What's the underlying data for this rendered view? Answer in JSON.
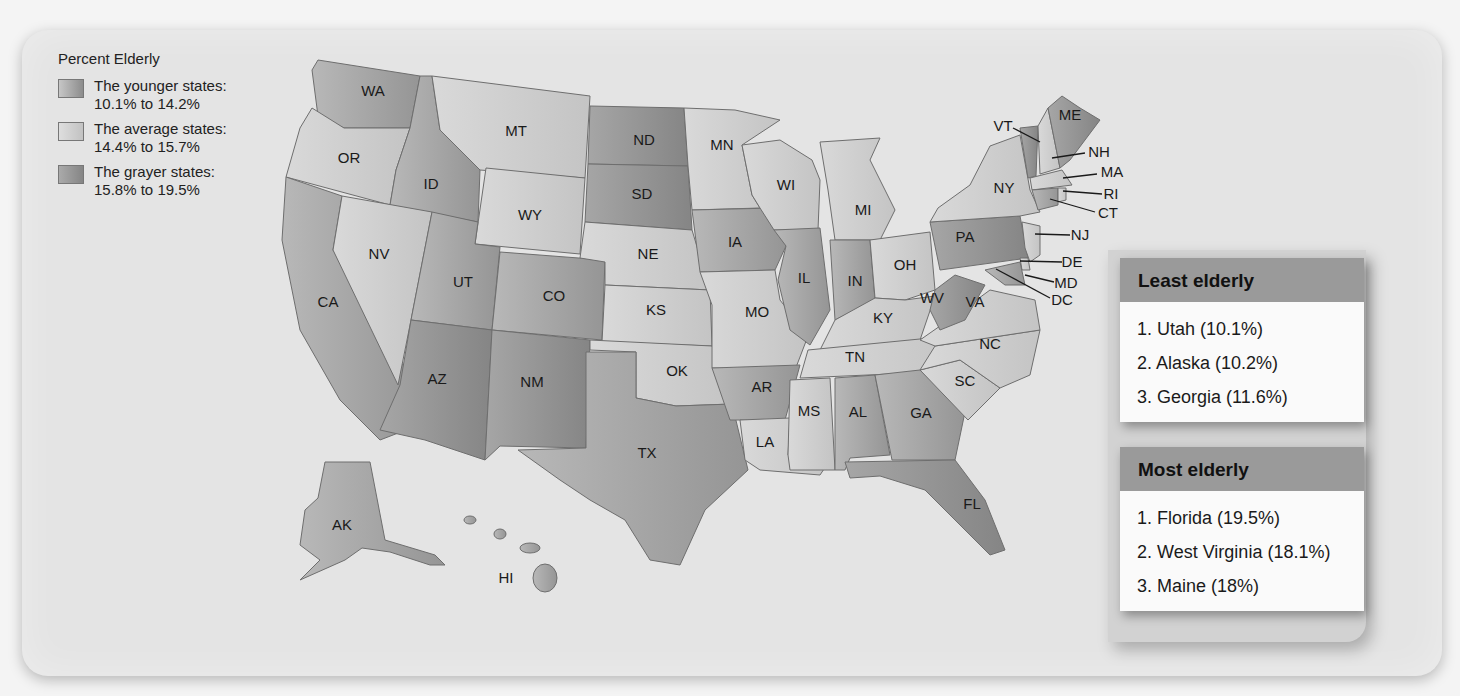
{
  "legend": {
    "title": "Percent Elderly",
    "items": [
      {
        "label_line1": "The younger states:",
        "label_line2": "10.1% to 14.2%",
        "color": "#a3a3a3"
      },
      {
        "label_line1": "The average states:",
        "label_line2": "14.4% to 15.7%",
        "color": "#cfcfcf"
      },
      {
        "label_line1": "The grayer states:",
        "label_line2": "15.8% to 19.5%",
        "color": "#8e8e8e"
      }
    ]
  },
  "least_elderly": {
    "title": "Least elderly",
    "items": [
      "1.  Utah (10.1%)",
      "2.  Alaska (10.2%)",
      "3.  Georgia (11.6%)"
    ]
  },
  "most_elderly": {
    "title": "Most elderly",
    "items": [
      "1.  Florida (19.5%)",
      "2.  West Virginia (18.1%)",
      "3.  Maine (18%)"
    ]
  },
  "colors": {
    "younger": "#a3a3a3",
    "average": "#cfcfcf",
    "grayer": "#8e8e8e",
    "panel": "#e4e4e4"
  },
  "states": {
    "WA": "WA",
    "OR": "OR",
    "CA": "CA",
    "ID": "ID",
    "NV": "NV",
    "MT": "MT",
    "WY": "WY",
    "UT": "UT",
    "CO": "CO",
    "AZ": "AZ",
    "NM": "NM",
    "ND": "ND",
    "SD": "SD",
    "NE": "NE",
    "KS": "KS",
    "OK": "OK",
    "TX": "TX",
    "MN": "MN",
    "IA": "IA",
    "MO": "MO",
    "AR": "AR",
    "LA": "LA",
    "WI": "WI",
    "IL": "IL",
    "MI": "MI",
    "IN": "IN",
    "OH": "OH",
    "KY": "KY",
    "TN": "TN",
    "MS": "MS",
    "AL": "AL",
    "GA": "GA",
    "FL": "FL",
    "SC": "SC",
    "NC": "NC",
    "VA": "VA",
    "WV": "WV",
    "PA": "PA",
    "NY": "NY",
    "VT": "VT",
    "ME": "ME",
    "NH": "NH",
    "MA": "MA",
    "RI": "RI",
    "CT": "CT",
    "NJ": "NJ",
    "DE": "DE",
    "MD": "MD",
    "DC": "DC",
    "AK": "AK",
    "HI": "HI"
  }
}
